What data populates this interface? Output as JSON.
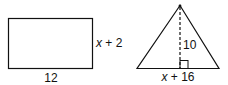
{
  "rectangle": {
    "width_label": "12",
    "height_label_var": "x",
    "height_label_rest": " + 2"
  },
  "triangle": {
    "height_label": "10",
    "base_label_var": "x",
    "base_label_rest": " + 16"
  },
  "colors": {
    "stroke": "#111111",
    "background": "#ffffff"
  }
}
